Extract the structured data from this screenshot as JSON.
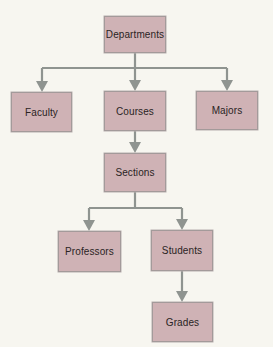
{
  "diagram": {
    "type": "hierarchy-tree",
    "colors": {
      "background": "#f7f6f0",
      "node_fill": "#cfb2b5",
      "node_border": "#a39a9a",
      "connector": "#8f9490",
      "text": "#2a2424"
    },
    "nodes": [
      {
        "id": "departments",
        "label": "Departments",
        "x": 104,
        "y": 16,
        "w": 62,
        "h": 37
      },
      {
        "id": "faculty",
        "label": "Faculty",
        "x": 11,
        "y": 92,
        "w": 61,
        "h": 40
      },
      {
        "id": "courses",
        "label": "Courses",
        "x": 104,
        "y": 91,
        "w": 62,
        "h": 40
      },
      {
        "id": "majors",
        "label": "Majors",
        "x": 196,
        "y": 91,
        "w": 62,
        "h": 39
      },
      {
        "id": "sections",
        "label": "Sections",
        "x": 104,
        "y": 153,
        "w": 62,
        "h": 39
      },
      {
        "id": "professors",
        "label": "Professors",
        "x": 58,
        "y": 231,
        "w": 63,
        "h": 41
      },
      {
        "id": "students",
        "label": "Students",
        "x": 151,
        "y": 230,
        "w": 62,
        "h": 41
      },
      {
        "id": "grades",
        "label": "Grades",
        "x": 152,
        "y": 302,
        "w": 61,
        "h": 40
      }
    ],
    "edges": [
      {
        "from": "Departments",
        "to": "Faculty"
      },
      {
        "from": "Departments",
        "to": "Courses"
      },
      {
        "from": "Departments",
        "to": "Majors"
      },
      {
        "from": "Courses",
        "to": "Sections"
      },
      {
        "from": "Sections",
        "to": "Professors"
      },
      {
        "from": "Sections",
        "to": "Students"
      },
      {
        "from": "Students",
        "to": "Grades"
      }
    ]
  }
}
